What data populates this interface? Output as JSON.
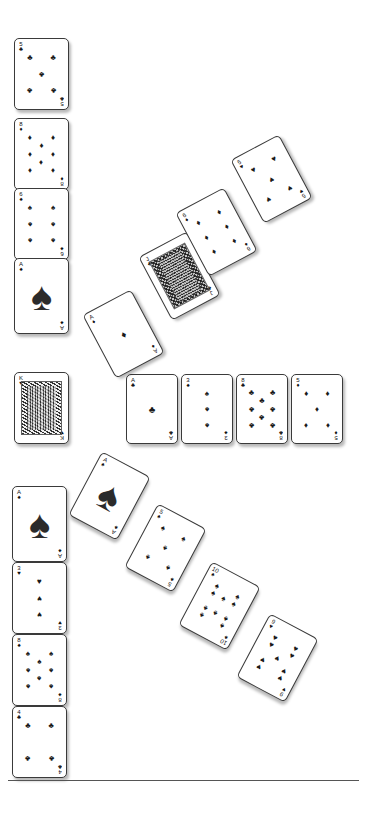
{
  "app": {
    "title": "Solitaire",
    "background_color": "#ffffff",
    "card_face_color": "#ffffff",
    "card_border_color": "#3a3a3a",
    "pip_color": "#1a1a1a"
  },
  "suits": {
    "spade": "♠",
    "heart": "♥",
    "diamond": "♦",
    "club": "♣"
  },
  "baseline": {
    "y": 780,
    "x": 8,
    "width": 351
  },
  "piles": {
    "left_column_top": {
      "name": "left-column-upper",
      "x": 12,
      "cards": [
        {
          "rank": "5",
          "suit": "club",
          "suit_name": "clubs",
          "label": "5 of Clubs",
          "x": 14,
          "y": 38,
          "w": 55,
          "h": 72,
          "rot": 0
        },
        {
          "rank": "8",
          "suit": "diamond",
          "suit_name": "diamonds",
          "label": "8 of Diamonds",
          "x": 14,
          "y": 118,
          "w": 55,
          "h": 72,
          "rot": 0
        },
        {
          "rank": "6",
          "suit": "spade",
          "suit_name": "spades",
          "label": "6 of Spades",
          "x": 14,
          "y": 188,
          "w": 55,
          "h": 72,
          "rot": 0
        },
        {
          "rank": "A",
          "suit": "spade",
          "suit_name": "spades",
          "label": "Ace of Spades",
          "x": 14,
          "y": 258,
          "w": 55,
          "h": 76,
          "rot": 0
        }
      ]
    },
    "left_column_middle": {
      "name": "left-column-king",
      "cards": [
        {
          "rank": "K",
          "suit": "heart",
          "suit_name": "hearts",
          "label": "King of Hearts",
          "x": 14,
          "y": 372,
          "w": 55,
          "h": 72,
          "rot": 0
        }
      ]
    },
    "left_column_bottom": {
      "name": "left-column-lower",
      "cards": [
        {
          "rank": "A",
          "suit": "spade",
          "suit_name": "spades",
          "label": "Ace of Spades",
          "x": 12,
          "y": 486,
          "w": 55,
          "h": 76,
          "rot": 0
        },
        {
          "rank": "3",
          "suit": "heart",
          "suit_name": "hearts",
          "label": "3 of Hearts",
          "x": 12,
          "y": 562,
          "w": 55,
          "h": 72,
          "rot": 0
        },
        {
          "rank": "8",
          "suit": "spade",
          "suit_name": "spades",
          "label": "8 of Spades",
          "x": 12,
          "y": 634,
          "w": 55,
          "h": 72,
          "rot": 0
        },
        {
          "rank": "4",
          "suit": "club",
          "suit_name": "clubs",
          "label": "4 of Clubs",
          "x": 12,
          "y": 706,
          "w": 55,
          "h": 72,
          "rot": 0
        }
      ]
    },
    "middle_row": {
      "name": "foundation-row",
      "cards": [
        {
          "rank": "A",
          "suit": "club",
          "suit_name": "clubs",
          "label": "Ace of Clubs",
          "x": 126,
          "y": 374,
          "w": 52,
          "h": 70,
          "rot": 0
        },
        {
          "rank": "3",
          "suit": "spade",
          "suit_name": "spades",
          "label": "3 of Spades",
          "x": 181,
          "y": 374,
          "w": 52,
          "h": 70,
          "rot": 0
        },
        {
          "rank": "8",
          "suit": "club",
          "suit_name": "clubs",
          "label": "8 of Clubs",
          "x": 236,
          "y": 374,
          "w": 52,
          "h": 70,
          "rot": 0
        },
        {
          "rank": "5",
          "suit": "diamond",
          "suit_name": "diamonds",
          "label": "5 of Diamonds",
          "x": 291,
          "y": 374,
          "w": 52,
          "h": 70,
          "rot": 0
        }
      ]
    },
    "upper_cascade": {
      "name": "upper-diagonal-cascade",
      "direction": "up-right",
      "cards": [
        {
          "rank": "A",
          "suit": "diamond",
          "suit_name": "diamonds",
          "label": "Ace of Diamonds",
          "x": 96,
          "y": 298,
          "w": 55,
          "h": 72,
          "rot": -28
        },
        {
          "rank": "J",
          "suit": "club",
          "suit_name": "clubs",
          "label": "Jack of Clubs",
          "x": 152,
          "y": 240,
          "w": 55,
          "h": 72,
          "rot": -28
        },
        {
          "rank": "6",
          "suit": "diamond",
          "suit_name": "diamonds",
          "label": "6 of Diamonds",
          "x": 189,
          "y": 196,
          "w": 55,
          "h": 72,
          "rot": -28
        },
        {
          "rank": "5",
          "suit": "heart",
          "suit_name": "hearts",
          "label": "5 of Hearts",
          "x": 244,
          "y": 143,
          "w": 55,
          "h": 72,
          "rot": -28
        }
      ]
    },
    "lower_cascade": {
      "name": "lower-diagonal-cascade",
      "direction": "down-right",
      "cards": [
        {
          "rank": "A",
          "suit": "spade",
          "suit_name": "spades",
          "label": "Ace of Spades",
          "x": 82,
          "y": 460,
          "w": 55,
          "h": 72,
          "rot": 28
        },
        {
          "rank": "5",
          "suit": "spade",
          "suit_name": "spades",
          "label": "5 of Spades",
          "x": 138,
          "y": 512,
          "w": 55,
          "h": 72,
          "rot": 28
        },
        {
          "rank": "10",
          "suit": "spade",
          "suit_name": "spades",
          "label": "10 of Spades",
          "x": 192,
          "y": 570,
          "w": 55,
          "h": 72,
          "rot": 28
        },
        {
          "rank": "9",
          "suit": "heart",
          "suit_name": "hearts",
          "label": "9 of Hearts",
          "x": 250,
          "y": 622,
          "w": 55,
          "h": 72,
          "rot": 28
        }
      ]
    }
  }
}
